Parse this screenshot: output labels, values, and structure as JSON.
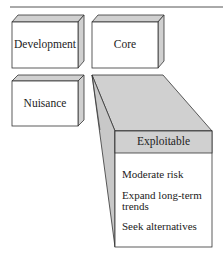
{
  "boxes": {
    "development": "Development",
    "core": "Core",
    "nuisance": "Nuisance"
  },
  "detail": {
    "title": "Exploitable",
    "items": [
      "Moderate risk",
      "Expand long-term trends",
      "Seek alternatives"
    ],
    "item_line1": "Expand long-term",
    "item_line2": "trends"
  },
  "colors": {
    "face": "#ffffff",
    "bevel": "#d0d0d0",
    "line": "#333333"
  }
}
